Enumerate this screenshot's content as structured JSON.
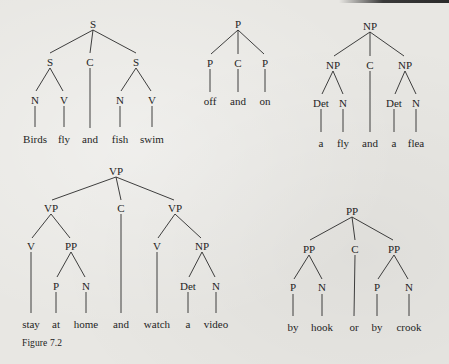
{
  "figure": {
    "label": "Figure 7.2"
  },
  "trees": [
    {
      "id": "s-coordination",
      "root": "S",
      "children": [
        {
          "label": "S",
          "children": [
            {
              "label": "N",
              "word": "Birds"
            },
            {
              "label": "V",
              "word": "fly"
            }
          ]
        },
        {
          "label": "C",
          "word": "and"
        },
        {
          "label": "S",
          "children": [
            {
              "label": "N",
              "word": "fish"
            },
            {
              "label": "V",
              "word": "swim"
            }
          ]
        }
      ],
      "nodes": {
        "root": "S",
        "l": "S",
        "c": "C",
        "r": "S",
        "ln": "N",
        "lv": "V",
        "rn": "N",
        "rv": "V"
      },
      "words": [
        "Birds",
        "fly",
        "and",
        "fish",
        "swim"
      ]
    },
    {
      "id": "p-coordination",
      "root": "P",
      "children": [
        {
          "label": "P",
          "word": "off"
        },
        {
          "label": "C",
          "word": "and"
        },
        {
          "label": "P",
          "word": "on"
        }
      ],
      "nodes": {
        "root": "P",
        "l": "P",
        "c": "C",
        "r": "P"
      },
      "words": [
        "off",
        "and",
        "on"
      ]
    },
    {
      "id": "np-coordination",
      "root": "NP",
      "children": [
        {
          "label": "NP",
          "children": [
            {
              "label": "Det",
              "word": "a"
            },
            {
              "label": "N",
              "word": "fly"
            }
          ]
        },
        {
          "label": "C",
          "word": "and"
        },
        {
          "label": "NP",
          "children": [
            {
              "label": "Det",
              "word": "a"
            },
            {
              "label": "N",
              "word": "flea"
            }
          ]
        }
      ],
      "nodes": {
        "root": "NP",
        "l": "NP",
        "c": "C",
        "r": "NP",
        "ldet": "Det",
        "ln": "N",
        "rdet": "Det",
        "rn": "N"
      },
      "words": [
        "a",
        "fly",
        "and",
        "a",
        "flea"
      ]
    },
    {
      "id": "vp-coordination",
      "root": "VP",
      "children": [
        {
          "label": "VP",
          "children": [
            {
              "label": "V",
              "word": "stay"
            },
            {
              "label": "PP",
              "children": [
                {
                  "label": "P",
                  "word": "at"
                },
                {
                  "label": "N",
                  "word": "home"
                }
              ]
            }
          ]
        },
        {
          "label": "C",
          "word": "and"
        },
        {
          "label": "VP",
          "children": [
            {
              "label": "V",
              "word": "watch"
            },
            {
              "label": "NP",
              "children": [
                {
                  "label": "Det",
                  "word": "a"
                },
                {
                  "label": "N",
                  "word": "video"
                }
              ]
            }
          ]
        }
      ],
      "nodes": {
        "root": "VP",
        "l": "VP",
        "c": "C",
        "r": "VP",
        "lv": "V",
        "lpp": "PP",
        "lp": "P",
        "ln": "N",
        "rv": "V",
        "rnp": "NP",
        "rdet": "Det",
        "rn": "N"
      },
      "words": [
        "stay",
        "at",
        "home",
        "and",
        "watch",
        "a",
        "video"
      ]
    },
    {
      "id": "pp-coordination",
      "root": "PP",
      "children": [
        {
          "label": "PP",
          "children": [
            {
              "label": "P",
              "word": "by"
            },
            {
              "label": "N",
              "word": "hook"
            }
          ]
        },
        {
          "label": "C",
          "word": "or"
        },
        {
          "label": "PP",
          "children": [
            {
              "label": "P",
              "word": "by"
            },
            {
              "label": "N",
              "word": "crook"
            }
          ]
        }
      ],
      "nodes": {
        "root": "PP",
        "l": "PP",
        "c": "C",
        "r": "PP",
        "lp": "P",
        "ln": "N",
        "rp": "P",
        "rn": "N"
      },
      "words": [
        "by",
        "hook",
        "or",
        "by",
        "crook"
      ]
    }
  ]
}
